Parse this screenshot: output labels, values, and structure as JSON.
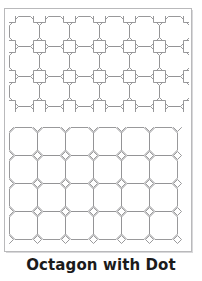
{
  "page": {
    "title": "Octagon with Dot",
    "background_color": "#ffffff",
    "frame": {
      "border_color": "#b9b9bb",
      "fill_color": "#ffffff",
      "x": 4,
      "y": 8,
      "width": 188,
      "height": 244
    },
    "caption": {
      "text": "Octagon with Dot",
      "color": "#1b1b1b",
      "font_size_px": 15,
      "bold": true,
      "align": "center"
    }
  },
  "patterns": [
    {
      "id": "octagon-with-square",
      "name": "Octagon and square tessellation",
      "position": {
        "x": 9,
        "y": 16
      },
      "size": {
        "width": 184,
        "height": 96
      },
      "stroke_color": "#8d8d90",
      "stroke_width": 0.9,
      "fill_color": "#ffffff",
      "tile": {
        "shape": "octagon",
        "cell_size_px": 30,
        "octagon_corner_cut_px": 9,
        "gap_shape": "square",
        "gap_size_px": 12,
        "gap_rotation_deg": 0
      },
      "grid": {
        "columns": 6,
        "rows": 4
      },
      "clipped_edges": [
        "right",
        "bottom"
      ]
    },
    {
      "id": "octagon-with-dot",
      "name": "Octagon and dot (diamond) tessellation",
      "position": {
        "x": 9,
        "y": 127
      },
      "size": {
        "width": 184,
        "height": 118
      },
      "stroke_color": "#8d8d90",
      "stroke_width": 0.9,
      "fill_color": "#ffffff",
      "tile": {
        "shape": "octagon",
        "cell_size_px": 28,
        "octagon_corner_cut_px": 5.5,
        "gap_shape": "diamond",
        "gap_size_px": 8,
        "gap_rotation_deg": 45
      },
      "grid": {
        "columns": 6,
        "rows": 4
      },
      "clipped_edges": [
        "right"
      ]
    }
  ]
}
